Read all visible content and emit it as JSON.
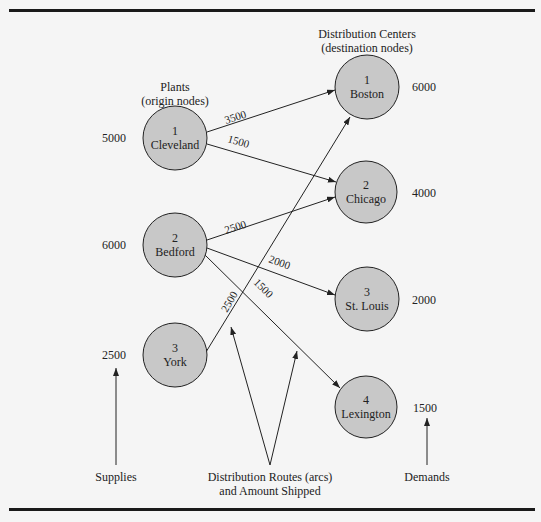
{
  "headers": {
    "plants_line1": "Plants",
    "plants_line2": "(origin nodes)",
    "dc_line1": "Distribution Centers",
    "dc_line2": "(destination nodes)"
  },
  "plants": [
    {
      "id": "1",
      "name": "Cleveland",
      "supply": "5000",
      "cx": 175,
      "cy": 138
    },
    {
      "id": "2",
      "name": "Bedford",
      "supply": "6000",
      "cx": 175,
      "cy": 245
    },
    {
      "id": "3",
      "name": "York",
      "supply": "2500",
      "cx": 175,
      "cy": 355
    }
  ],
  "centers": [
    {
      "id": "1",
      "name": "Boston",
      "demand": "6000",
      "cx": 367,
      "cy": 87
    },
    {
      "id": "2",
      "name": "Chicago",
      "demand": "4000",
      "cx": 366,
      "cy": 192
    },
    {
      "id": "3",
      "name": "St. Louis",
      "demand": "2000",
      "cx": 367,
      "cy": 299
    },
    {
      "id": "4",
      "name": "Lexington",
      "demand": "1500",
      "cx": 366,
      "cy": 407
    }
  ],
  "routes": [
    {
      "from": "Cleveland",
      "to": "Boston",
      "amount": "3500"
    },
    {
      "from": "Cleveland",
      "to": "Chicago",
      "amount": "1500"
    },
    {
      "from": "Bedford",
      "to": "Chicago",
      "amount": "2500"
    },
    {
      "from": "Bedford",
      "to": "St. Louis",
      "amount": "2000"
    },
    {
      "from": "Bedford",
      "to": "Lexington",
      "amount": "1500"
    },
    {
      "from": "York",
      "to": "Boston",
      "amount": "2500"
    }
  ],
  "footer": {
    "supplies": "Supplies",
    "routes_line1": "Distribution Routes (arcs)",
    "routes_line2": "and Amount Shipped",
    "demands": "Demands"
  }
}
